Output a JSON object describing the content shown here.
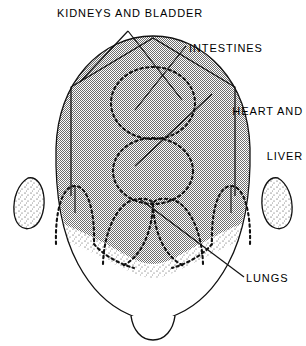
{
  "figure": {
    "view": "top-of-head",
    "line_color": "#111111",
    "shade_color": "#9a9a9a",
    "stipple_color": "#2b2b2b",
    "background_color": "#ffffff"
  },
  "labels": {
    "kidneys": "KIDNEYS AND BLADDER",
    "intestines": "INTESTINES",
    "heart_line1": "HEART AND",
    "heart_line2": "LIVER",
    "lungs": "LUNGS"
  },
  "zones": [
    {
      "id": "kidneys-bladder",
      "label": "KIDNEYS AND BLADDER",
      "shape": "pentagon-outline"
    },
    {
      "id": "intestines",
      "label": "INTESTINES",
      "shape": "dashed-circle-upper"
    },
    {
      "id": "heart-liver",
      "label": "HEART AND LIVER",
      "shape": "dashed-circle-lower"
    },
    {
      "id": "lungs",
      "label": "LUNGS",
      "shape": "dashed-arches"
    }
  ],
  "anatomy": [
    {
      "id": "head-outline",
      "label": "head outline"
    },
    {
      "id": "scalp-shading",
      "label": "shaded scalp area"
    },
    {
      "id": "left-ear",
      "label": "left ear"
    },
    {
      "id": "right-ear",
      "label": "right ear"
    },
    {
      "id": "face-area",
      "label": "face and chin"
    },
    {
      "id": "chin",
      "label": "chin"
    }
  ]
}
